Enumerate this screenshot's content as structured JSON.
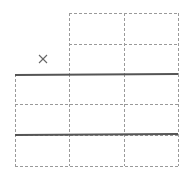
{
  "canvas": {
    "width": 187,
    "height": 173,
    "background": "#ffffff"
  },
  "colors": {
    "dashed": "#9a9a9a",
    "solid": "#555555",
    "mark": "#666666"
  },
  "grid": {
    "top_block": {
      "x": [
        69,
        124,
        178
      ],
      "y": [
        13,
        44,
        74
      ]
    },
    "bottom_block": {
      "x": [
        15,
        69,
        124,
        178
      ],
      "y": [
        74,
        104,
        135,
        166
      ]
    }
  },
  "solid_lines": [
    {
      "x1": 15,
      "y1": 75,
      "x2": 178,
      "y2": 74
    },
    {
      "x1": 15,
      "y1": 135,
      "x2": 178,
      "y2": 134
    }
  ],
  "mark": {
    "symbol": "×",
    "x": 43,
    "y": 59
  }
}
